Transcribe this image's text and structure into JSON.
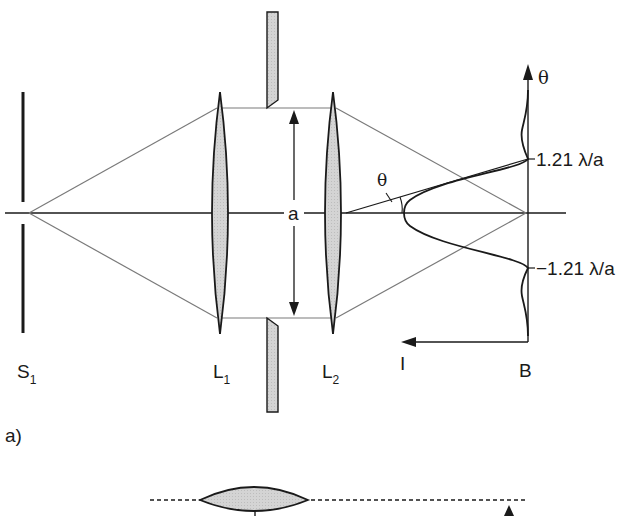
{
  "figure": {
    "panel_label": "a)",
    "labels": {
      "source_slit": {
        "main": "S",
        "sub": "1"
      },
      "lens1": {
        "main": "L",
        "sub": "1"
      },
      "lens2": {
        "main": "L",
        "sub": "2"
      },
      "aperture_width": "a",
      "angle": "θ",
      "screen": "B",
      "intensity_axis": "I",
      "angle_axis": "θ",
      "first_min_upper": "1.21 λ/a",
      "first_min_lower": "−1.21 λ/a"
    },
    "colors": {
      "line": "#1a1a1a",
      "ray": "#7a7a7a",
      "lens_fill": "#cfcfcf",
      "background": "#ffffff"
    }
  }
}
